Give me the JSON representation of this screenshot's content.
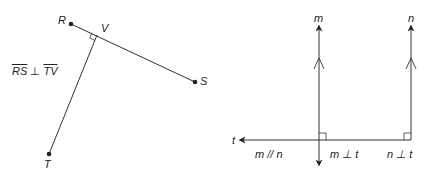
{
  "colors": {
    "ink": "#222222",
    "background": "#ffffff"
  },
  "left_figure": {
    "points": {
      "R": {
        "label": "R",
        "x": 71,
        "y": 24
      },
      "V": {
        "label": "V",
        "x": 97,
        "y": 35
      },
      "S": {
        "label": "S",
        "x": 195,
        "y": 82
      },
      "T": {
        "label": "T",
        "x": 49,
        "y": 154
      }
    },
    "segments": [
      "RS",
      "TV"
    ],
    "statement": {
      "a": "RS",
      "perp": "⊥",
      "b": "TV"
    }
  },
  "right_figure": {
    "lines": {
      "m": {
        "label": "m"
      },
      "n": {
        "label": "n"
      },
      "t": {
        "label": "t"
      }
    },
    "statements": {
      "parallel": "m // n",
      "m_perp_t": "m ⊥ t",
      "n_perp_t": "n ⊥ t"
    }
  }
}
